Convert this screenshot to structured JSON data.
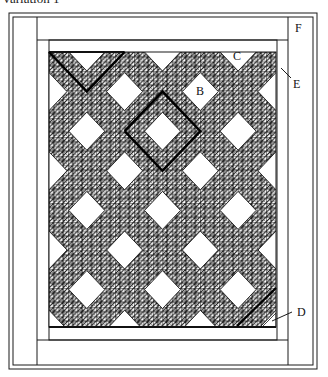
{
  "caption": "Variation 1",
  "colors": {
    "line": "#1a1a1a",
    "fill_bg": "#ffffff",
    "pattern_bg": "#5a5a5a"
  },
  "frame": {
    "outer1": [
      9,
      13,
      317,
      369
    ],
    "outer2": [
      13,
      17,
      313,
      365
    ],
    "left_strip_x": 37,
    "right_strip_x": 288,
    "top_strip_y": 40,
    "bottom_strip_y": 340,
    "inner_border": [
      49,
      40,
      277,
      340
    ],
    "quilt": [
      49,
      52,
      276,
      327
    ]
  },
  "pattern": {
    "cell_size": 4.72,
    "col_centers": [
      49,
      86.8,
      124.6,
      162.5,
      200.3,
      238.1,
      276
    ],
    "row_centers": [
      52,
      91.6,
      131.2,
      170.8,
      210.4,
      250,
      289.6,
      329.2
    ],
    "diamond_half_w": 18,
    "diamond_half_h": 19
  },
  "bold_lines": [
    {
      "name": "top-left-block-outline",
      "points": "49,52 86.8,91.6 124.6,52"
    },
    {
      "name": "center-block-outline",
      "points": "124.6,131.2 162.5,91.6 200.3,131.2 162.5,170.8 124.6,131.2"
    },
    {
      "name": "bottom-right-block-edge",
      "points": "237,326 276,288"
    }
  ],
  "labels": [
    {
      "id": "B",
      "text": "B",
      "x": 196,
      "y": 95,
      "leader": null
    },
    {
      "id": "C",
      "text": "C",
      "x": 233,
      "y": 60,
      "leader": null
    },
    {
      "id": "D",
      "text": "D",
      "x": 297,
      "y": 316,
      "leader": "272,321 292,312"
    },
    {
      "id": "E",
      "text": "E",
      "x": 293,
      "y": 88,
      "leader": "281,68 291,78"
    },
    {
      "id": "F",
      "text": "F",
      "x": 295,
      "y": 32,
      "leader": null
    }
  ]
}
